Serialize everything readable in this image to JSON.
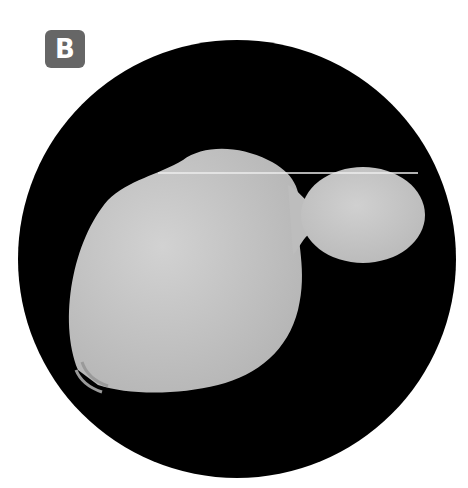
{
  "figure": {
    "panel_label": "B",
    "label_color": "#666666",
    "background_color": "#000000",
    "cell_color": "#c8c8c8"
  }
}
